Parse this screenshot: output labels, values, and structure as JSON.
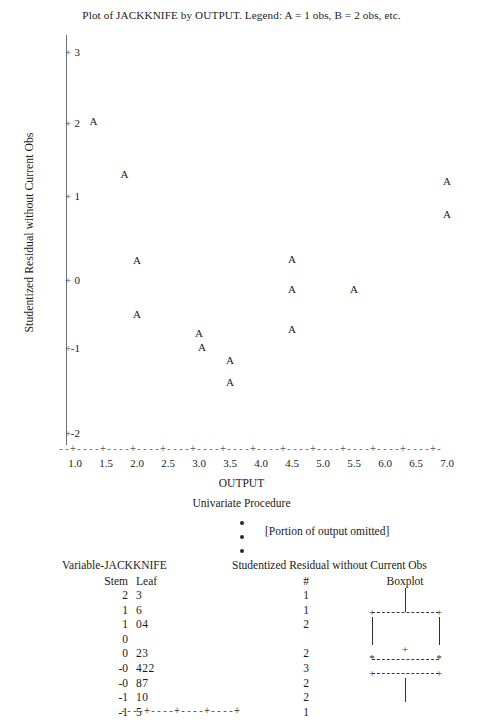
{
  "plot": {
    "title": "Plot of JACKKNIFE by OUTPUT.  Legend:  A = 1 obs, B = 2 obs, etc.",
    "xlabel": "OUTPUT",
    "ylabel": "Studentized Residual without Current Obs",
    "x_ticks": [
      "1.0",
      "1.5",
      "2.0",
      "2.5",
      "3.0",
      "3.5",
      "4.0",
      "4.5",
      "5.0",
      "5.5",
      "6.0",
      "6.5",
      "7.0"
    ],
    "y_ticks": [
      "3",
      "2",
      "1",
      "0",
      "-1",
      "-2"
    ],
    "axis_rule": "--+----+----+----+----+----+----+----+----+----+----+----+----+-",
    "point_glyph": "A"
  },
  "chart_data": {
    "type": "scatter",
    "title": "Plot of JACKKNIFE by OUTPUT.  Legend:  A = 1 obs, B = 2 obs, etc.",
    "xlabel": "OUTPUT",
    "ylabel": "Studentized Residual without Current Obs",
    "xlim": [
      0.8,
      7.2
    ],
    "ylim": [
      -2.3,
      3.3
    ],
    "xticks": [
      1.0,
      1.5,
      2.0,
      2.5,
      3.0,
      3.5,
      4.0,
      4.5,
      5.0,
      5.5,
      6.0,
      6.5,
      7.0
    ],
    "yticks": [
      3,
      2,
      1,
      0,
      -1,
      -2
    ],
    "grid": false,
    "legend": "A = 1 obs, B = 2 obs, etc.",
    "marker_label": "A",
    "points": [
      {
        "x": 1.3,
        "y": 2.3,
        "label": "A"
      },
      {
        "x": 1.8,
        "y": 1.55,
        "label": "A"
      },
      {
        "x": 2.0,
        "y": 0.35,
        "label": "A"
      },
      {
        "x": 2.0,
        "y": -0.4,
        "label": "A"
      },
      {
        "x": 3.0,
        "y": -0.67,
        "label": "A"
      },
      {
        "x": 3.05,
        "y": -0.87,
        "label": "A"
      },
      {
        "x": 3.5,
        "y": -1.05,
        "label": "A"
      },
      {
        "x": 3.5,
        "y": -1.35,
        "label": "A"
      },
      {
        "x": 4.5,
        "y": 0.36,
        "label": "A"
      },
      {
        "x": 4.5,
        "y": -0.06,
        "label": "A"
      },
      {
        "x": 4.5,
        "y": -0.62,
        "label": "A"
      },
      {
        "x": 5.5,
        "y": -0.06,
        "label": "A"
      },
      {
        "x": 7.0,
        "y": 1.45,
        "label": "A"
      },
      {
        "x": 7.0,
        "y": 1.0,
        "label": "A"
      }
    ]
  },
  "univariate": {
    "heading": "Univariate Procedure",
    "omitted_note": "[Portion of output omitted]",
    "bullet": "•"
  },
  "stemleaf": {
    "variable_title": "Variable-JACKKNIFE",
    "right_title": "Studentized Residual without Current Obs",
    "header_stem": "Stem",
    "header_leaf": "Leaf",
    "header_count": "#",
    "header_boxplot": "Boxplot",
    "baseline": "----+----+----+----+",
    "rows": [
      {
        "stem": "2",
        "leaf": "3",
        "count": "1"
      },
      {
        "stem": "1",
        "leaf": "6",
        "count": "1"
      },
      {
        "stem": "1",
        "leaf": "04",
        "count": "2"
      },
      {
        "stem": "0",
        "leaf": "",
        "count": ""
      },
      {
        "stem": "0",
        "leaf": "23",
        "count": "2"
      },
      {
        "stem": "-0",
        "leaf": "422",
        "count": "3"
      },
      {
        "stem": "-0",
        "leaf": "87",
        "count": "2"
      },
      {
        "stem": "-1",
        "leaf": "10",
        "count": "2"
      },
      {
        "stem": "-1",
        "leaf": "5",
        "count": "1"
      }
    ],
    "boxplot_marks": {
      "whisker_cap": "+",
      "fence": "*",
      "mean": "+"
    }
  }
}
